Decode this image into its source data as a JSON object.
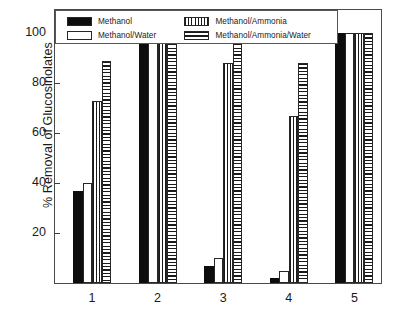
{
  "chart_data": {
    "type": "bar",
    "title": "",
    "xlabel": "",
    "ylabel": "% Removal of Glucosinolates",
    "categories": [
      "1",
      "2",
      "3",
      "4",
      "5"
    ],
    "ylim": [
      0,
      110
    ],
    "yticks": [
      20,
      40,
      60,
      80,
      100
    ],
    "ytick_labels": [
      "20",
      "40",
      "60",
      "80",
      "100"
    ],
    "grid": false,
    "legend_position": "top-left-inside",
    "series": [
      {
        "name": "Methanol",
        "pattern": "solid-black",
        "values": [
          37,
          100,
          7,
          2,
          100
        ]
      },
      {
        "name": "Methanol/Water",
        "pattern": "empty-white",
        "values": [
          40,
          100,
          10,
          5,
          100
        ]
      },
      {
        "name": "Methanol/Ammonia",
        "pattern": "vertical-stripes",
        "values": [
          73,
          100,
          88,
          67,
          100
        ]
      },
      {
        "name": "Methanol/Ammonia/Water",
        "pattern": "horizontal-stripes",
        "values": [
          89,
          100,
          100,
          88,
          100
        ]
      }
    ]
  },
  "legend": {
    "entries": [
      {
        "label": "Methanol",
        "pattern": "solid-black"
      },
      {
        "label": "Methanol/Ammonia",
        "pattern": "vertical-stripes"
      },
      {
        "label": "Methanol/Water",
        "pattern": "empty-white"
      },
      {
        "label": "Methanol/Ammonia/Water",
        "pattern": "horizontal-stripes"
      }
    ]
  },
  "colors": {
    "bar_fill_dark": "#0d0d0d",
    "bar_outline": "#262626",
    "axis": "#4a4a4a",
    "background": "#ffffff",
    "text": "#1a1a1a"
  }
}
